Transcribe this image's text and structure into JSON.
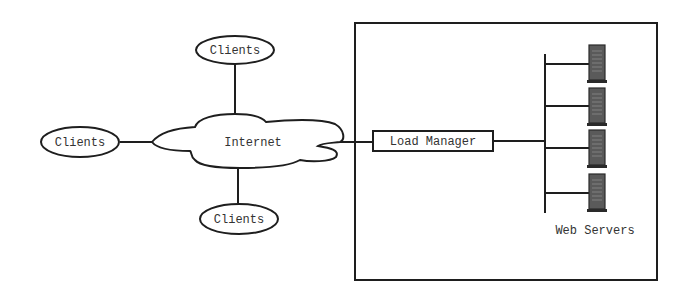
{
  "diagram": {
    "type": "network-architecture",
    "nodes": {
      "clients_top": {
        "label": "Clients",
        "shape": "ellipse"
      },
      "clients_left": {
        "label": "Clients",
        "shape": "ellipse"
      },
      "clients_bottom": {
        "label": "Clients",
        "shape": "ellipse"
      },
      "internet": {
        "label": "Internet",
        "shape": "cloud"
      },
      "load_manager": {
        "label": "Load Manager",
        "shape": "rectangle"
      },
      "web_servers": {
        "label": "Web Servers",
        "count": 4,
        "icon": "server-tower-icon"
      }
    },
    "edges": [
      {
        "from": "clients_top",
        "to": "internet"
      },
      {
        "from": "clients_left",
        "to": "internet"
      },
      {
        "from": "clients_bottom",
        "to": "internet"
      },
      {
        "from": "internet",
        "to": "load_manager"
      },
      {
        "from": "load_manager",
        "to": "web_servers_bus"
      },
      {
        "from": "web_servers_bus",
        "to": "server_1"
      },
      {
        "from": "web_servers_bus",
        "to": "server_2"
      },
      {
        "from": "web_servers_bus",
        "to": "server_3"
      },
      {
        "from": "web_servers_bus",
        "to": "server_4"
      }
    ],
    "groups": [
      {
        "name": "server-site",
        "contains": [
          "load_manager",
          "web_servers"
        ]
      }
    ],
    "colors": {
      "stroke": "#1e1e1e",
      "text": "#333333",
      "server_fill": "#5a5a5a",
      "background": "#ffffff"
    }
  }
}
